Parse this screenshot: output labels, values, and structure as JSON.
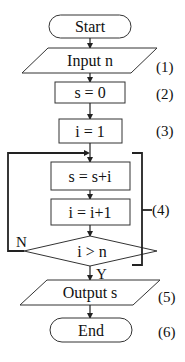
{
  "flowchart": {
    "start": {
      "text": "Start"
    },
    "input": {
      "text": "Input n",
      "step": "(1)"
    },
    "init_s": {
      "text": "s = 0",
      "step": "(2)"
    },
    "init_i": {
      "text": "i = 1",
      "step": "(3)"
    },
    "accumulate": {
      "text": "s = s+i"
    },
    "increment": {
      "text": "i = i+1"
    },
    "condition": {
      "text": "i > n",
      "no_label": "N",
      "yes_label": "Y"
    },
    "loop_group": {
      "step": "(4)"
    },
    "output": {
      "text": "Output s",
      "step": "(5)"
    },
    "end": {
      "text": "End",
      "step": "(6)"
    }
  },
  "colors": {
    "stroke": "#222222",
    "background": "#ffffff",
    "text": "#111111"
  }
}
